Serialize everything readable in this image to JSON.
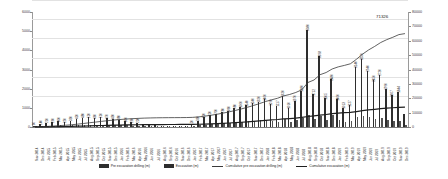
{
  "chart_data": {
    "type": "bar",
    "title": "",
    "xlabel": "",
    "ylabel": "",
    "ylim": [
      0,
      6000
    ],
    "y2lim": [
      0,
      80000
    ],
    "grid": true,
    "legend_position": "bottom",
    "y_ticks_left": [
      "6000",
      "5000",
      "4000",
      "3000",
      "2000",
      "1000",
      "0"
    ],
    "y_ticks_right": [
      "80000",
      "70000",
      "60000",
      "50000",
      "40000",
      "30000",
      "20000",
      "10000",
      "0"
    ],
    "annotations": [
      {
        "text": "71326",
        "series": "Cumulative excavation (m)"
      }
    ],
    "categories": [
      "Nov 2014",
      "Dec 2014",
      "Jan 2015",
      "Feb 2015",
      "Mar 2015",
      "Apr 2015",
      "May 2015",
      "Jun 2015",
      "Jul 2015",
      "Aug 2015",
      "Sep 2015",
      "Oct 2015",
      "Nov 2015",
      "Dec 2015",
      "Jan 2016",
      "Feb 2016",
      "Mar 2016",
      "Apr 2016",
      "May 2016",
      "Jun 2016",
      "Jul 2016",
      "Aug 2016",
      "Sep 2016",
      "Oct 2016",
      "Nov 2016",
      "Dec 2016",
      "Jan 2017",
      "Feb 2017",
      "Mar 2017",
      "Apr 2017",
      "May 2017",
      "Jun 2017",
      "Jul 2017",
      "Aug 2017",
      "Sep 2017",
      "Oct 2017",
      "Nov 2017",
      "Dec 2017",
      "Jan 2018",
      "Feb 2018",
      "Mar 2018",
      "Apr 2018",
      "May 2018",
      "Jun 2018",
      "Jul 2018",
      "Aug 2018",
      "Sep 2018",
      "Oct 2018",
      "Nov 2018",
      "Dec 2018",
      "Jan 2019",
      "Feb 2019",
      "Mar 2019",
      "Apr 2019",
      "May 2019",
      "Jun 2019",
      "Jul 2019",
      "Aug 2019",
      "Sep 2019",
      "Oct 2019",
      "Nov 2019",
      "Dec 2019"
    ],
    "series": [
      {
        "name": "Pre excavation drilling (m)",
        "axis": "left",
        "type": "bar",
        "color": "#2e2e2e",
        "values": [
          60,
          140,
          210,
          260,
          300,
          250,
          330,
          420,
          480,
          520,
          460,
          510,
          470,
          430,
          380,
          300,
          260,
          220,
          180,
          120,
          90,
          60,
          40,
          30,
          20,
          40,
          120,
          330,
          520,
          620,
          700,
          780,
          860,
          980,
          1060,
          1140,
          1240,
          1320,
          1460,
          1190,
          1117,
          1620,
          1010,
          1370,
          1880,
          5080,
          1712,
          3698,
          1505,
          2480,
          1460,
          1013,
          1127,
          3140,
          3550,
          2940,
          2450,
          2720,
          1990,
          1667,
          1844,
          700
        ]
      },
      {
        "name": "Excavation (m)",
        "axis": "left",
        "type": "bar",
        "color": "#555555",
        "values": [
          20,
          40,
          60,
          70,
          80,
          70,
          90,
          110,
          120,
          130,
          120,
          130,
          120,
          110,
          100,
          80,
          70,
          60,
          50,
          40,
          30,
          20,
          15,
          12,
          10,
          15,
          40,
          90,
          130,
          160,
          180,
          200,
          220,
          250,
          270,
          290,
          310,
          340,
          370,
          300,
          280,
          410,
          260,
          350,
          470,
          620,
          430,
          560,
          380,
          630,
          370,
          260,
          290,
          520,
          600,
          510,
          420,
          470,
          340,
          290,
          320,
          130
        ]
      },
      {
        "name": "Cumulative pre excavation drilling (m)",
        "axis": "right",
        "type": "line",
        "color": "#3a3a3a",
        "values": [
          60,
          200,
          410,
          670,
          970,
          1220,
          1550,
          1970,
          2450,
          2970,
          3430,
          3940,
          4410,
          4840,
          5220,
          5520,
          5780,
          6000,
          6180,
          6300,
          6390,
          6450,
          6490,
          6520,
          6540,
          6580,
          6700,
          7030,
          7550,
          8170,
          8870,
          9650,
          10510,
          11490,
          12550,
          13690,
          14930,
          16250,
          17710,
          18900,
          20017,
          21637,
          22647,
          24017,
          25897,
          30977,
          32689,
          36387,
          37892,
          40372,
          41832,
          42845,
          43972,
          47112,
          50662,
          53602,
          56052,
          58772,
          60762,
          62429,
          64273,
          64973
        ]
      },
      {
        "name": "Cumulative excavation (m)",
        "axis": "right",
        "type": "line",
        "color": "#1f1f1f",
        "values": [
          20,
          60,
          120,
          190,
          270,
          340,
          430,
          540,
          660,
          790,
          910,
          1040,
          1160,
          1270,
          1370,
          1450,
          1520,
          1580,
          1630,
          1670,
          1700,
          1720,
          1735,
          1747,
          1757,
          1772,
          1812,
          1902,
          2032,
          2192,
          2372,
          2572,
          2792,
          3042,
          3312,
          3602,
          3912,
          4252,
          4622,
          4922,
          5202,
          5612,
          5872,
          6222,
          6692,
          7312,
          7742,
          8302,
          8682,
          9312,
          9682,
          9942,
          10232,
          10752,
          11352,
          11862,
          12282,
          12752,
          13092,
          13382,
          13702,
          13832
        ]
      }
    ],
    "bar_value_labels": [
      {
        "index": 0,
        "text": "60"
      },
      {
        "index": 1,
        "text": "140"
      },
      {
        "index": 2,
        "text": "210"
      },
      {
        "index": 3,
        "text": "260"
      },
      {
        "index": 4,
        "text": "300"
      },
      {
        "index": 5,
        "text": "250"
      },
      {
        "index": 6,
        "text": "330"
      },
      {
        "index": 7,
        "text": "420"
      },
      {
        "index": 8,
        "text": "480"
      },
      {
        "index": 9,
        "text": "520"
      },
      {
        "index": 10,
        "text": "460"
      },
      {
        "index": 11,
        "text": "510"
      },
      {
        "index": 12,
        "text": "470"
      },
      {
        "index": 13,
        "text": "430"
      },
      {
        "index": 14,
        "text": "380"
      },
      {
        "index": 15,
        "text": "300"
      },
      {
        "index": 16,
        "text": "260"
      },
      {
        "index": 17,
        "text": "220"
      },
      {
        "index": 26,
        "text": "120"
      },
      {
        "index": 27,
        "text": "330"
      },
      {
        "index": 28,
        "text": "520"
      },
      {
        "index": 29,
        "text": "620"
      },
      {
        "index": 30,
        "text": "700"
      },
      {
        "index": 31,
        "text": "780"
      },
      {
        "index": 32,
        "text": "860"
      },
      {
        "index": 33,
        "text": "980"
      },
      {
        "index": 34,
        "text": "1060"
      },
      {
        "index": 35,
        "text": "1140"
      },
      {
        "index": 36,
        "text": "1240"
      },
      {
        "index": 37,
        "text": "1320"
      },
      {
        "index": 38,
        "text": "1460"
      },
      {
        "index": 39,
        "text": "1190"
      },
      {
        "index": 40,
        "text": "1117"
      },
      {
        "index": 41,
        "text": "1620"
      },
      {
        "index": 42,
        "text": "1010"
      },
      {
        "index": 43,
        "text": "1370"
      },
      {
        "index": 44,
        "text": "1880"
      },
      {
        "index": 45,
        "text": "5080"
      },
      {
        "index": 46,
        "text": "1712"
      },
      {
        "index": 47,
        "text": "3698"
      },
      {
        "index": 48,
        "text": "1505"
      },
      {
        "index": 49,
        "text": "2480"
      },
      {
        "index": 50,
        "text": "1460"
      },
      {
        "index": 51,
        "text": "1013"
      },
      {
        "index": 52,
        "text": "1127"
      },
      {
        "index": 53,
        "text": "3140"
      },
      {
        "index": 54,
        "text": "3550"
      },
      {
        "index": 55,
        "text": "2940"
      },
      {
        "index": 56,
        "text": "2450"
      },
      {
        "index": 57,
        "text": "2720"
      },
      {
        "index": 58,
        "text": "1990"
      },
      {
        "index": 59,
        "text": "1667"
      },
      {
        "index": 60,
        "text": "1844"
      }
    ]
  },
  "legend": {
    "items": [
      {
        "label": "Pre excavation drilling (m)",
        "marker": "bar"
      },
      {
        "label": "Excavation (m)",
        "marker": "bar"
      },
      {
        "label": "Cumulative pre excavation drilling (m)",
        "marker": "line"
      },
      {
        "label": "Cumulative excavation (m)",
        "marker": "line-bold"
      }
    ]
  }
}
